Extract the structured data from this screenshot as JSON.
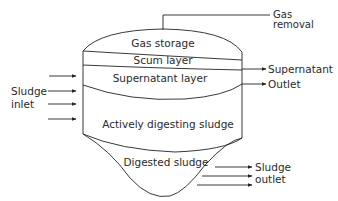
{
  "diagram": {
    "type": "anaerobic-digester-cross-section",
    "zones": [
      {
        "id": "gas",
        "label": "Gas storage"
      },
      {
        "id": "scum",
        "label": "Scum layer"
      },
      {
        "id": "supernatant",
        "label": "Supernatant layer"
      },
      {
        "id": "active",
        "label": "Actively digesting sludge"
      },
      {
        "id": "digested",
        "label": "Digested sludge"
      }
    ],
    "external_labels": {
      "gas_removal_1": "Gas",
      "gas_removal_2": "removal",
      "supernatant_1": "Supernatant",
      "supernatant_2": "Outlet",
      "sludge_inlet_1": "Sludge",
      "sludge_inlet_2": "inlet",
      "sludge_outlet_1": "Sludge",
      "sludge_outlet_2": "outlet"
    },
    "colors": {
      "line": "#222222",
      "text": "#2a2a2a",
      "background": "#ffffff"
    }
  }
}
